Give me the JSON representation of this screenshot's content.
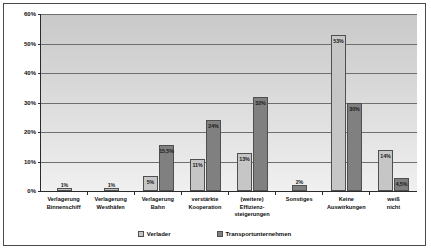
{
  "chart_data": {
    "type": "bar",
    "title": "",
    "xlabel": "",
    "ylabel": "",
    "ylim": [
      0,
      60
    ],
    "yticks": [
      "0%",
      "10%",
      "20%",
      "30%",
      "40%",
      "50%",
      "60%"
    ],
    "ytick_values": [
      0,
      10,
      20,
      30,
      40,
      50,
      60
    ],
    "grid": true,
    "legend_position": "bottom",
    "categories": [
      "Verlagerung Binnenschiff",
      "Verlagerung Westhäfen",
      "Verlagerung Bahn",
      "verstärkte Kooperation",
      "(weitere) Effizienz-steigerungen",
      "Sonstiges",
      "Keine Auswirkungen",
      "weiß nicht"
    ],
    "series": [
      {
        "name": "Verlader",
        "color": "#c6c6c6",
        "values": [
          1,
          1,
          5,
          11,
          13,
          null,
          53,
          14
        ],
        "labels": [
          "1%",
          "1%",
          "5%",
          "11%",
          "13%",
          "",
          "53%",
          "14%"
        ]
      },
      {
        "name": "Transportunternehmen",
        "color": "#808080",
        "values": [
          null,
          null,
          15.5,
          24,
          32,
          2,
          30,
          4.5
        ],
        "labels": [
          "",
          "",
          "15,5%",
          "24%",
          "32%",
          "2%",
          "30%",
          "4,5%"
        ]
      }
    ]
  },
  "legend": {
    "items": [
      {
        "label": "Verlader",
        "swatch": "light"
      },
      {
        "label": "Transportunternehmen",
        "swatch": "dark"
      }
    ]
  }
}
